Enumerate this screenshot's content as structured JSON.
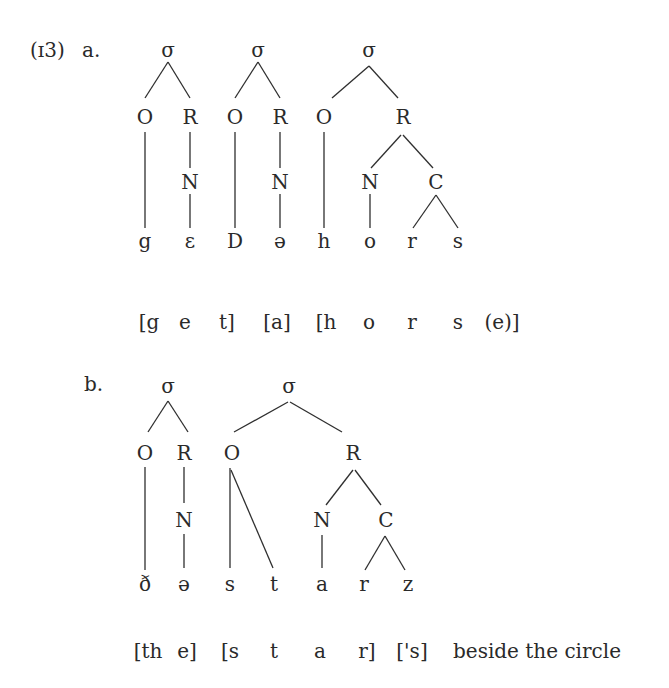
{
  "example": {
    "number": "(ɪ3)",
    "part_a": {
      "label": "a.",
      "syllables": [
        "σ",
        "σ",
        "σ"
      ],
      "nodes": {
        "o1": "O",
        "r1": "R",
        "o2": "O",
        "r2": "R",
        "o3": "O",
        "r3": "R",
        "n1": "N",
        "n2": "N",
        "n3": "N",
        "c3": "C"
      },
      "segments": [
        "g",
        "ɛ",
        "D",
        "ə",
        "h",
        "o",
        "r",
        "s"
      ],
      "orthography": [
        "[g",
        "e",
        "t]",
        "[a]",
        "[h",
        "o",
        "r",
        "s",
        "(e)]"
      ]
    },
    "part_b": {
      "label": "b.",
      "syllables": [
        "σ",
        "σ"
      ],
      "nodes": {
        "o1": "O",
        "r1": "R",
        "o2": "O",
        "r2": "R",
        "n1": "N",
        "n2": "N",
        "c2": "C"
      },
      "segments": [
        "ð",
        "ə",
        "s",
        "t",
        "a",
        "r",
        "z"
      ],
      "orthography": [
        "[th",
        "e]",
        "[s",
        "t",
        "a",
        "r]",
        "['s]",
        "beside the circle"
      ]
    }
  }
}
